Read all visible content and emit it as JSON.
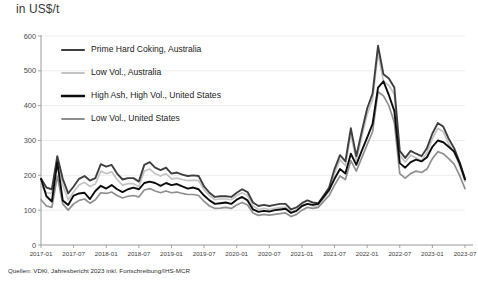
{
  "axis_title": "in US$/t",
  "source_note": "Quellen: VDKi, Jahresbericht 2023 inkl. Fortschreibung/IHS-MCR",
  "colors": {
    "background": "#ffffff",
    "gridline": "#e9eaec",
    "axis": "#9a9a9a",
    "series_prime_hard_coking_australia": "#3f3f3f",
    "series_low_vol_australia": "#c4c4c4",
    "series_high_ash_high_vol_us": "#0d0d0d",
    "series_low_vol_us": "#8f8f8f",
    "text": "#1c1c1c"
  },
  "legend": {
    "position": "inside-top-left",
    "entries": [
      {
        "label": "Prime Hard Coking, Australia",
        "color": "#3f3f3f",
        "width": 2.2
      },
      {
        "label": "Low Vol., Australia",
        "color": "#c4c4c4",
        "width": 1.8
      },
      {
        "label": "High Ash, High Vol., United States",
        "color": "#0d0d0d",
        "width": 2.4
      },
      {
        "label": "Low Vol., United States",
        "color": "#8f8f8f",
        "width": 1.8
      }
    ]
  },
  "chart_data": {
    "type": "line",
    "title": "",
    "subtitle": "",
    "xlabel": "",
    "ylabel": "in US$/t",
    "ylim": [
      0,
      600
    ],
    "yticks": [
      0,
      100,
      200,
      300,
      400,
      500,
      600
    ],
    "grid": true,
    "legend_position": "inside-top-left",
    "x_tick_labels": [
      "2017-01",
      "2017-07",
      "2018-01",
      "2018-07",
      "2019-01",
      "2019-07",
      "2020-01",
      "2020-07",
      "2021-01",
      "2021-07",
      "2022-01",
      "2022-07",
      "2023-01",
      "2023-07"
    ],
    "x_tick_index": [
      0,
      6,
      12,
      18,
      24,
      30,
      36,
      42,
      48,
      54,
      60,
      66,
      72,
      78
    ],
    "x": [
      "2017-01",
      "2017-02",
      "2017-03",
      "2017-04",
      "2017-05",
      "2017-06",
      "2017-07",
      "2017-08",
      "2017-09",
      "2017-10",
      "2017-11",
      "2017-12",
      "2018-01",
      "2018-02",
      "2018-03",
      "2018-04",
      "2018-05",
      "2018-06",
      "2018-07",
      "2018-08",
      "2018-09",
      "2018-10",
      "2018-11",
      "2018-12",
      "2019-01",
      "2019-02",
      "2019-03",
      "2019-04",
      "2019-05",
      "2019-06",
      "2019-07",
      "2019-08",
      "2019-09",
      "2019-10",
      "2019-11",
      "2019-12",
      "2020-01",
      "2020-02",
      "2020-03",
      "2020-04",
      "2020-05",
      "2020-06",
      "2020-07",
      "2020-08",
      "2020-09",
      "2020-10",
      "2020-11",
      "2020-12",
      "2021-01",
      "2021-02",
      "2021-03",
      "2021-04",
      "2021-05",
      "2021-06",
      "2021-07",
      "2021-08",
      "2021-09",
      "2021-10",
      "2021-11",
      "2021-12",
      "2022-01",
      "2022-02",
      "2022-03",
      "2022-04",
      "2022-05",
      "2022-06",
      "2022-07",
      "2022-08",
      "2022-09",
      "2022-10",
      "2022-11",
      "2022-12",
      "2023-01",
      "2023-02",
      "2023-03",
      "2023-04",
      "2023-05",
      "2023-06",
      "2023-07"
    ],
    "series": [
      {
        "name": "Prime Hard Coking, Australia",
        "color": "#3f3f3f",
        "values": [
          190,
          165,
          160,
          255,
          190,
          148,
          168,
          190,
          198,
          185,
          192,
          232,
          225,
          230,
          205,
          188,
          192,
          192,
          182,
          230,
          238,
          222,
          215,
          222,
          205,
          208,
          202,
          198,
          200,
          198,
          168,
          150,
          138,
          140,
          140,
          138,
          150,
          160,
          152,
          122,
          112,
          115,
          112,
          115,
          118,
          118,
          102,
          108,
          120,
          128,
          122,
          120,
          142,
          165,
          218,
          258,
          240,
          335,
          255,
          325,
          392,
          435,
          572,
          490,
          478,
          452,
          270,
          250,
          270,
          262,
          255,
          278,
          320,
          350,
          340,
          305,
          278,
          238,
          190
        ]
      },
      {
        "name": "Low Vol., Australia",
        "color": "#c4c4c4",
        "values": [
          172,
          150,
          148,
          238,
          172,
          130,
          152,
          172,
          180,
          168,
          175,
          212,
          205,
          210,
          188,
          172,
          176,
          176,
          168,
          212,
          218,
          205,
          198,
          205,
          190,
          192,
          188,
          185,
          186,
          185,
          158,
          142,
          130,
          132,
          132,
          130,
          142,
          150,
          142,
          112,
          102,
          105,
          102,
          105,
          108,
          108,
          95,
          100,
          112,
          118,
          112,
          112,
          132,
          155,
          205,
          245,
          228,
          318,
          242,
          310,
          375,
          418,
          550,
          470,
          458,
          432,
          258,
          238,
          258,
          250,
          242,
          265,
          305,
          335,
          325,
          290,
          265,
          228,
          182
        ]
      },
      {
        "name": "High Ash, High Vol., United States",
        "color": "#0d0d0d",
        "values": [
          190,
          140,
          125,
          238,
          128,
          115,
          142,
          148,
          150,
          132,
          155,
          170,
          162,
          172,
          160,
          152,
          160,
          165,
          160,
          178,
          182,
          178,
          170,
          178,
          172,
          175,
          168,
          162,
          165,
          160,
          142,
          128,
          118,
          120,
          122,
          118,
          130,
          138,
          128,
          102,
          95,
          98,
          96,
          100,
          102,
          104,
          92,
          98,
          112,
          118,
          115,
          118,
          138,
          158,
          190,
          218,
          205,
          262,
          230,
          270,
          308,
          348,
          452,
          470,
          430,
          385,
          235,
          222,
          238,
          245,
          240,
          252,
          282,
          300,
          295,
          282,
          268,
          235,
          188
        ]
      },
      {
        "name": "Low Vol., United States",
        "color": "#8f8f8f",
        "values": [
          130,
          112,
          108,
          198,
          118,
          100,
          118,
          128,
          132,
          120,
          130,
          150,
          148,
          152,
          142,
          135,
          140,
          142,
          138,
          158,
          162,
          155,
          150,
          155,
          150,
          152,
          148,
          145,
          145,
          142,
          125,
          112,
          105,
          106,
          108,
          105,
          115,
          122,
          115,
          92,
          85,
          88,
          86,
          88,
          90,
          92,
          82,
          88,
          100,
          108,
          105,
          108,
          125,
          142,
          172,
          198,
          188,
          242,
          212,
          250,
          288,
          325,
          440,
          428,
          400,
          352,
          205,
          192,
          205,
          212,
          208,
          218,
          248,
          268,
          262,
          248,
          232,
          200,
          162
        ]
      }
    ]
  },
  "plot_geometry": {
    "left": 41,
    "right": 465,
    "top": 36,
    "bottom": 245
  }
}
